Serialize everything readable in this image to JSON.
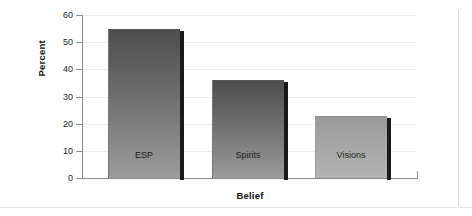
{
  "chart_data": {
    "type": "bar",
    "title": "",
    "subtitle": "",
    "xlabel": "Belief",
    "ylabel": "Percent",
    "categories": [
      "ESP",
      "Spirits",
      "Visions"
    ],
    "values": [
      55,
      36,
      23
    ],
    "ylim": [
      0,
      60
    ],
    "yticks": [
      0,
      10,
      20,
      30,
      40,
      50,
      60
    ],
    "ytick_labels": [
      "0",
      "10",
      "20",
      "30",
      "40",
      "50",
      "60"
    ],
    "grid": "horizontal",
    "legend": "none",
    "bar_colors": [
      "#6f6f6f",
      "#6f6f6f",
      "#a6a6a6"
    ],
    "label_placement": "inside-bottom",
    "annotations": []
  },
  "figure": {
    "background_color": "#ffffff",
    "axis_color": "#8a8a8a",
    "grid_color": "#ededed",
    "border_color": "#dedede"
  }
}
